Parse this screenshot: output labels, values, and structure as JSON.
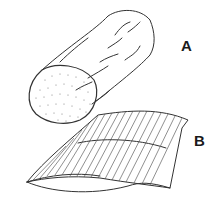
{
  "figure": {
    "panels": [
      {
        "id": "A",
        "label": "A",
        "subject": "cylindrical log with stippled cut end",
        "icon": "log-icon"
      },
      {
        "id": "B",
        "label": "B",
        "subject": "split slab with longitudinal grain lines",
        "icon": "slab-icon"
      }
    ],
    "caption": "",
    "colors": {
      "line": "#333333",
      "background": "#ffffff",
      "label": "#1a1a1a"
    }
  }
}
